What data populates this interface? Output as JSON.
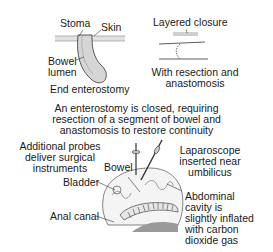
{
  "panels": {
    "end_enterostomy": {
      "caption": "End enterostomy",
      "labels": {
        "stoma": "Stoma",
        "skin": "Skin",
        "bowel_lumen_line1": "Bowel",
        "bowel_lumen_line2": "lumen"
      }
    },
    "resection": {
      "label": "Layered closure",
      "caption_line1": "With resection and",
      "caption_line2": "anastomosis"
    },
    "description": {
      "line1": "An enterostomy is closed, requiring",
      "line2": "resection of a segment of bowel and",
      "line3": "anastomosis to restore continuity"
    },
    "laparoscopy": {
      "probes_line1": "Additional probes",
      "probes_line2": "deliver surgical",
      "probes_line3": "instruments",
      "bowel": "Bowel",
      "bladder": "Bladder",
      "anal_canal": "Anal canal",
      "laparoscope_line1": "Laparoscope",
      "laparoscope_line2": "inserted near",
      "laparoscope_line3": "umbilicus",
      "cavity_line1": "Abdominal",
      "cavity_line2": "cavity is",
      "cavity_line3": "slightly inflated",
      "cavity_line4": "with carbon",
      "cavity_line5": "dioxide gas"
    }
  },
  "colors": {
    "ink": "#1a1a1a",
    "tissue_fill": "#d9d9d9",
    "shadow": "#9a9a9a"
  }
}
